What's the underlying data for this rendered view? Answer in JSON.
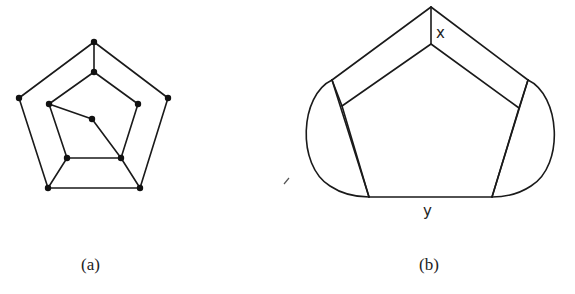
{
  "figure": {
    "panels": [
      {
        "id": "a",
        "caption": "(a)",
        "description": "Graph with outer pentagon, inner pentagon, and a center vertex",
        "vertices": {
          "outer_top": [
            94,
            42
          ],
          "outer_left": [
            19,
            98
          ],
          "outer_right": [
            168,
            98
          ],
          "outer_bottom_left": [
            48,
            188
          ],
          "outer_bottom_right": [
            140,
            188
          ],
          "inner_top": [
            94,
            72
          ],
          "inner_left": [
            49,
            104
          ],
          "inner_right": [
            138,
            104
          ],
          "inner_bottom_left": [
            67,
            158
          ],
          "inner_bottom_right": [
            121,
            158
          ],
          "center": [
            92,
            119
          ]
        }
      },
      {
        "id": "b",
        "caption": "(b)",
        "description": "Pentagon inside a rounded outer boundary with labeled regions",
        "labels": {
          "top_edge": "x",
          "bottom_edge": "y"
        }
      }
    ],
    "colors": {
      "stroke": "#1a1a1a",
      "vertex": "#111111",
      "background": "#ffffff"
    }
  }
}
